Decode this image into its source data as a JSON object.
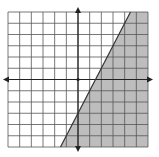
{
  "chart_data": {
    "type": "inequality-graph",
    "title": "",
    "xlabel": "",
    "ylabel": "",
    "xlim": [
      -6,
      6
    ],
    "ylim": [
      -6,
      6
    ],
    "grid": true,
    "grid_step": 1,
    "boundary_line": {
      "slope": 2,
      "intercept": -3,
      "style": "solid",
      "equation": "y = 2x - 3"
    },
    "shaded_region": "below-right",
    "inequality": "y <= 2x - 3",
    "colors": {
      "grid": "#555555",
      "axis": "#222222",
      "shade": "#bdbdbd",
      "line": "#333333",
      "background": "#ffffff"
    }
  }
}
